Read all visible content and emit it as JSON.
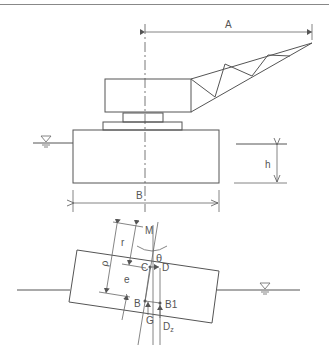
{
  "header": {
    "text": "··· · · ···"
  },
  "top_view": {
    "labels": {
      "A": "A",
      "B": "B",
      "h": "h"
    },
    "water_symbol": "water-level-symbol"
  },
  "tilted_view": {
    "labels": {
      "M": "M",
      "theta": "θ",
      "C": "C",
      "D": "D",
      "B": "B",
      "B1": "B1",
      "G": "G",
      "Dz": "D",
      "Dz_sub": "z",
      "rho": "ρ",
      "r": "r",
      "e": "e"
    },
    "water_symbol": "water-level-symbol"
  },
  "colors": {
    "line": "#555555",
    "background": "#ffffff"
  }
}
